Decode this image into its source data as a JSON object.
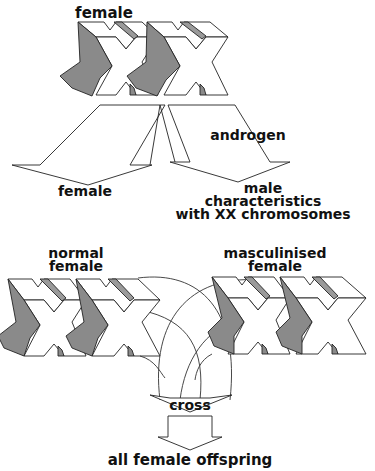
{
  "figure": {
    "top": {
      "label": "female",
      "chromosomes": "XX"
    },
    "branches": {
      "left_label": "female",
      "treatment_label": "androgen",
      "right_label_line1": "male",
      "right_label_line2": "characteristics",
      "right_label_line3": "with XX chromosomes"
    },
    "cross_parents": {
      "left_label_line1": "normal",
      "left_label_line2": "female",
      "right_label_line1": "masculinised",
      "right_label_line2": "female",
      "left_chromosomes": "XX",
      "right_chromosomes": "XX"
    },
    "result": {
      "cross_label": "cross",
      "offspring_label": "all female offspring"
    },
    "colors": {
      "background": "#ffffff",
      "line": "#222222",
      "shade": "#8a8a8a"
    }
  }
}
